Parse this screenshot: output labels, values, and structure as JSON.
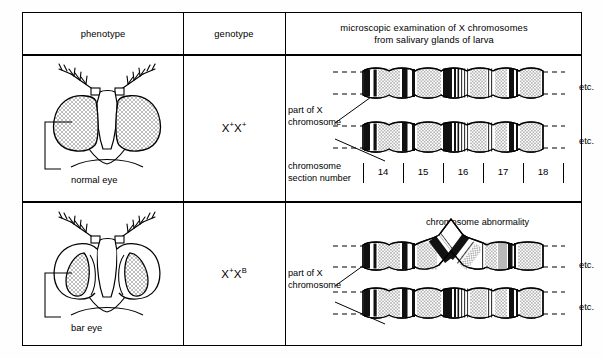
{
  "table": {
    "headers": [
      {
        "id": "phenotype",
        "label": "phenotype"
      },
      {
        "id": "genotype",
        "label": "genotype"
      },
      {
        "id": "microscopy",
        "line1": "microscopic examination of X chromosomes",
        "line2": "from salivary glands of larva"
      }
    ],
    "rows": [
      {
        "id": "normal-row",
        "phenotype_label": "normal eye",
        "genotype_base1": "X",
        "genotype_sup1": "+",
        "genotype_base2": "X",
        "genotype_sup2": "+",
        "chromosome_label_line1": "part of X",
        "chromosome_label_line2": "chromosome",
        "etc_top": "etc.",
        "etc_bottom": "etc.",
        "section_caption_line1": "chromosome",
        "section_caption_line2": "section number",
        "section_numbers": [
          "14",
          "15",
          "16",
          "17",
          "18"
        ]
      },
      {
        "id": "bar-row",
        "phenotype_label": "bar eye",
        "genotype_base1": "X",
        "genotype_sup1": "+",
        "genotype_base2": "X",
        "genotype_sup2": "B",
        "chromosome_label_line1": "part of X",
        "chromosome_label_line2": "chromosome",
        "etc_top": "etc.",
        "etc_bottom": "etc.",
        "abnormality_label": "chromosome abnormality"
      }
    ]
  },
  "colors": {
    "ink": "#000000",
    "band_dark": "#111111",
    "band_stipple": "#d9d9d9",
    "paper": "#ffffff"
  }
}
